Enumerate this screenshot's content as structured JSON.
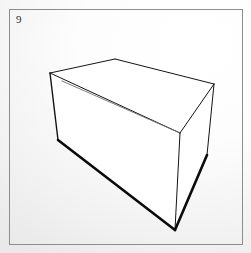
{
  "plate": {
    "figure_number": "9",
    "frame": {
      "x": 9,
      "y": 9,
      "width": 234,
      "height": 236,
      "stroke_color": "#8d8d8d"
    },
    "background": {
      "paper_light": "#ffffff",
      "paper_mid": "#f4f4f4",
      "paper_shadow": "#e6e6e6"
    }
  },
  "drawing": {
    "subject": "rectangular-box-line-drawing",
    "ink_color": "#141414",
    "heavy_ink_color": "#0b0b0b",
    "faint_ink_color": "#6f6f6f",
    "face_fill": "#ffffff",
    "vertices": {
      "top_back_left": {
        "x": 50,
        "y": 73
      },
      "top_back_apex": {
        "x": 115,
        "y": 59
      },
      "top_right": {
        "x": 214,
        "y": 84
      },
      "top_front_mid": {
        "x": 180,
        "y": 133
      },
      "left_lower": {
        "x": 58,
        "y": 140
      },
      "right_lower": {
        "x": 207,
        "y": 155
      },
      "bottom_apex": {
        "x": 175,
        "y": 230
      },
      "inner_crease_start": {
        "x": 62,
        "y": 81
      }
    },
    "faces": {
      "top_face": "50,73 115,59 214,84 180,133",
      "left_face": "50,73 180,133 175,230 58,140",
      "right_face": "180,133 214,84 207,155 175,230"
    },
    "edges": [
      {
        "name": "top-back-left-to-apex",
        "weight": "thin",
        "path": "50,73 115,59"
      },
      {
        "name": "apex-to-top-right",
        "weight": "thin",
        "path": "115,59 214,84"
      },
      {
        "name": "top-right-to-front-mid",
        "weight": "thin",
        "path": "214,84 180,133"
      },
      {
        "name": "front-mid-to-top-back-left",
        "weight": "thin",
        "path": "180,133 50,73"
      },
      {
        "name": "left-vertical-upper",
        "weight": "medium",
        "path": "50,73 58,140"
      },
      {
        "name": "left-lower-to-bottom-apex",
        "weight": "heavy",
        "path": "58,140 175,230"
      },
      {
        "name": "front-vertical",
        "weight": "thin",
        "path": "180,133 175,230"
      },
      {
        "name": "right-vertical",
        "weight": "thin",
        "path": "214,84 207,155"
      },
      {
        "name": "right-lower-to-bottom-apex",
        "weight": "heavy",
        "path": "207,155 175,230"
      },
      {
        "name": "inner-crease",
        "weight": "faint",
        "path": "62,81 180,133"
      }
    ]
  }
}
